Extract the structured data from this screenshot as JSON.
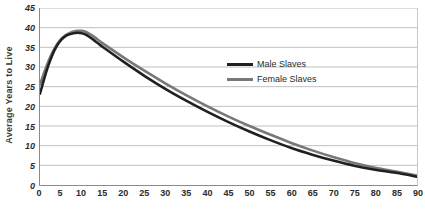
{
  "chart_data": {
    "type": "line",
    "title": "",
    "xlabel": "",
    "ylabel": "Average Years to Live",
    "xlim": [
      0,
      90
    ],
    "ylim": [
      0,
      45
    ],
    "grid": true,
    "legend_position": "upper-right-inside",
    "x_ticks": [
      0,
      5,
      10,
      15,
      20,
      25,
      30,
      35,
      40,
      45,
      50,
      55,
      60,
      65,
      70,
      75,
      80,
      85,
      90
    ],
    "y_ticks": [
      0,
      5,
      10,
      15,
      20,
      25,
      30,
      35,
      40,
      45
    ],
    "x": [
      0,
      1,
      2,
      3,
      4,
      5,
      6,
      7,
      8,
      9,
      10,
      11,
      12,
      13,
      14,
      15,
      20,
      25,
      30,
      35,
      40,
      45,
      50,
      55,
      60,
      65,
      70,
      75,
      80,
      85,
      90
    ],
    "series": [
      {
        "name": "Male Slaves",
        "color": "#231f20",
        "values": [
          23.2,
          27.0,
          30.4,
          33.2,
          35.3,
          36.8,
          37.8,
          38.3,
          38.6,
          38.7,
          38.6,
          38.2,
          37.5,
          36.7,
          35.9,
          35.1,
          31.3,
          27.7,
          24.4,
          21.4,
          18.6,
          16.0,
          13.6,
          11.4,
          9.4,
          7.7,
          6.2,
          4.9,
          3.9,
          3.1,
          2.1
        ]
      },
      {
        "name": "Female Slaves",
        "color": "#77787b",
        "values": [
          25.6,
          28.6,
          31.4,
          33.8,
          35.7,
          37.1,
          38.0,
          38.6,
          39.0,
          39.2,
          39.2,
          38.9,
          38.3,
          37.6,
          36.8,
          36.0,
          32.4,
          29.0,
          25.8,
          22.8,
          20.0,
          17.4,
          15.0,
          12.8,
          10.7,
          8.8,
          7.1,
          5.6,
          4.4,
          3.4,
          2.4
        ]
      }
    ]
  },
  "legend": {
    "entries": [
      {
        "label": "Male Slaves",
        "color": "#231f20"
      },
      {
        "label": "Female Slaves",
        "color": "#77787b"
      }
    ]
  },
  "axes": {
    "y_title": "Average Years to Live"
  },
  "style": {
    "gridline_color": "#bfbfbf",
    "axis_color": "#8a8a8a",
    "background": "#ffffff"
  }
}
